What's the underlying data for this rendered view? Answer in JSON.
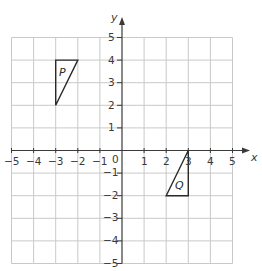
{
  "diagram": {
    "type": "coordinate-grid",
    "x_axis": {
      "label": "x",
      "min": -5,
      "max": 5,
      "ticks": [
        "-5",
        "-4",
        "-3",
        "-2",
        "-1",
        "1",
        "2",
        "3",
        "4",
        "5"
      ]
    },
    "y_axis": {
      "label": "y",
      "min": -5,
      "max": 5,
      "ticks": [
        "5",
        "4",
        "3",
        "2",
        "1",
        "-1",
        "-2",
        "-3",
        "-4",
        "-5"
      ]
    },
    "origin_label": "0",
    "shapes": [
      {
        "name": "P",
        "type": "triangle",
        "vertices": [
          [
            -3,
            4
          ],
          [
            -2,
            4
          ],
          [
            -3,
            2
          ]
        ]
      },
      {
        "name": "Q",
        "type": "triangle",
        "vertices": [
          [
            3,
            0
          ],
          [
            3,
            -2
          ],
          [
            2,
            -2
          ]
        ]
      }
    ],
    "colors": {
      "grid": "#c9c9c9",
      "axis": "#3a3a3a",
      "shape": "#2a2a2a",
      "background": "#ffffff"
    }
  },
  "labels": {
    "x_axis_name": "x",
    "y_axis_name": "y",
    "origin": "0",
    "x_ticks": {
      "n5": "−5",
      "n4": "−4",
      "n3": "−3",
      "n2": "−2",
      "n1": "−1",
      "p1": "1",
      "p2": "2",
      "p3": "3",
      "p4": "4",
      "p5": "5"
    },
    "y_ticks": {
      "p5": "5",
      "p4": "4",
      "p3": "3",
      "p2": "2",
      "p1": "1",
      "n1": "−1",
      "n2": "−2",
      "n3": "−3",
      "n4": "−4",
      "n5": "−5"
    },
    "shape_p": "P",
    "shape_q": "Q"
  }
}
